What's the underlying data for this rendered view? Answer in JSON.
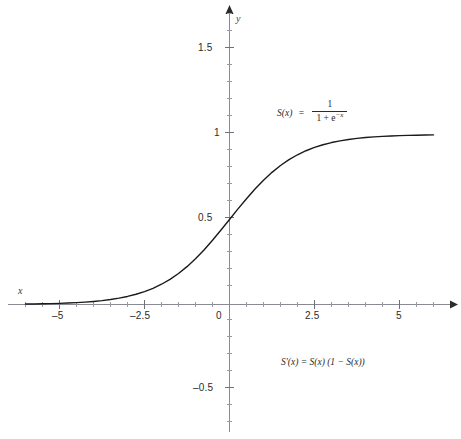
{
  "chart_data": {
    "type": "line",
    "title": "",
    "subtitle": "",
    "xlabel": "x",
    "ylabel": "y",
    "xlim": [
      -6.0,
      6.0
    ],
    "ylim": [
      -0.75,
      1.7
    ],
    "grid": false,
    "legend": "none",
    "axes_style": "arrowed-cross-axes",
    "xticks": [
      -5,
      -2.5,
      0,
      2.5,
      5
    ],
    "xtick_labels": [
      "–5",
      "–2.5",
      "0",
      "2.5",
      "5"
    ],
    "yticks": [
      -0.5,
      0.5,
      1,
      1.5
    ],
    "ytick_labels": [
      "–0.5",
      "0.5",
      "1",
      "1.5"
    ],
    "minor_ticks_per_interval": 4,
    "series": [
      {
        "name": "S(x) = 1 / (1 + e^-x)",
        "color": "#1a1a1a",
        "x": [
          -6.0,
          -5.75,
          -5.5,
          -5.25,
          -5.0,
          -4.75,
          -4.5,
          -4.25,
          -4.0,
          -3.75,
          -3.5,
          -3.25,
          -3.0,
          -2.75,
          -2.5,
          -2.25,
          -2.0,
          -1.75,
          -1.5,
          -1.25,
          -1.0,
          -0.75,
          -0.5,
          -0.25,
          0.0,
          0.25,
          0.5,
          0.75,
          1.0,
          1.25,
          1.5,
          1.75,
          2.0,
          2.25,
          2.5,
          2.75,
          3.0,
          3.25,
          3.5,
          3.75,
          4.0,
          4.25,
          4.5,
          4.75,
          5.0,
          5.25,
          5.5,
          5.75,
          6.0
        ],
        "y": [
          0.0025,
          0.0032,
          0.0041,
          0.0052,
          0.0067,
          0.0086,
          0.011,
          0.014,
          0.018,
          0.023,
          0.0293,
          0.0373,
          0.0474,
          0.0601,
          0.0759,
          0.0952,
          0.1192,
          0.148,
          0.1824,
          0.2227,
          0.2689,
          0.3208,
          0.3775,
          0.4378,
          0.5,
          0.5622,
          0.6225,
          0.6792,
          0.7311,
          0.7773,
          0.8176,
          0.852,
          0.8808,
          0.9045,
          0.9241,
          0.9399,
          0.9526,
          0.9627,
          0.9707,
          0.977,
          0.982,
          0.986,
          0.989,
          0.9914,
          0.9933,
          0.9948,
          0.9959,
          0.9968,
          0.9975
        ]
      }
    ],
    "annotations": [
      {
        "name": "sigmoid-definition",
        "text": "S(x) = 1 / (1 + e^-x)",
        "lhs": "S(x)",
        "equals": "=",
        "numerator": "1",
        "denominator_base": "1 + e",
        "denominator_exponent": "−x",
        "x_data": 1.05,
        "y_data": 1.22
      },
      {
        "name": "sigmoid-derivative",
        "text": "S′(x) = S(x) (1 − S(x))",
        "x_data": 1.1,
        "y_data": -0.37
      }
    ]
  },
  "axis_labels": {
    "x": "x",
    "y": "y"
  },
  "tick_labels": {
    "x": {
      "neg5": "–5",
      "neg2_5": "–2.5",
      "zero": "0",
      "pos2_5": "2.5",
      "pos5": "5"
    },
    "y": {
      "pos1_5": "1.5",
      "pos1": "1",
      "pos0_5": "0.5",
      "neg0_5": "–0.5"
    }
  },
  "formulas": {
    "definition": {
      "lhs": "S(x)",
      "equals": "=",
      "numerator": "1",
      "denominator_base": "1 + e",
      "denominator_exponent": "−x"
    },
    "derivative": "S′(x) = S(x) (1 − S(x))"
  },
  "caption": {
    "text": ""
  },
  "colors": {
    "curve": "#1a1a1a",
    "axis": "#7a7a8a",
    "tick_text": "#2b2b2b",
    "background": "#ffffff"
  }
}
